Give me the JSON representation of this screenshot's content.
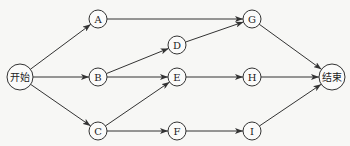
{
  "diagram": {
    "type": "network-flow",
    "nodes": [
      {
        "id": "start",
        "label": "开始",
        "x": 20,
        "y": 77,
        "r": 13
      },
      {
        "id": "A",
        "label": "A",
        "x": 98,
        "y": 19,
        "r": 9
      },
      {
        "id": "B",
        "label": "B",
        "x": 98,
        "y": 77,
        "r": 9
      },
      {
        "id": "C",
        "label": "C",
        "x": 98,
        "y": 131,
        "r": 9
      },
      {
        "id": "D",
        "label": "D",
        "x": 177,
        "y": 45,
        "r": 9
      },
      {
        "id": "E",
        "label": "E",
        "x": 177,
        "y": 77,
        "r": 9
      },
      {
        "id": "F",
        "label": "F",
        "x": 177,
        "y": 131,
        "r": 9
      },
      {
        "id": "G",
        "label": "G",
        "x": 252,
        "y": 19,
        "r": 9
      },
      {
        "id": "H",
        "label": "H",
        "x": 252,
        "y": 77,
        "r": 9
      },
      {
        "id": "I",
        "label": "I",
        "x": 252,
        "y": 131,
        "r": 9
      },
      {
        "id": "end",
        "label": "结束",
        "x": 332,
        "y": 77,
        "r": 13
      }
    ],
    "edges": [
      [
        "start",
        "A"
      ],
      [
        "start",
        "B"
      ],
      [
        "start",
        "C"
      ],
      [
        "A",
        "G"
      ],
      [
        "B",
        "D"
      ],
      [
        "B",
        "E"
      ],
      [
        "C",
        "E"
      ],
      [
        "C",
        "F"
      ],
      [
        "D",
        "G"
      ],
      [
        "E",
        "H"
      ],
      [
        "F",
        "I"
      ],
      [
        "G",
        "end"
      ],
      [
        "H",
        "end"
      ],
      [
        "I",
        "end"
      ]
    ]
  }
}
